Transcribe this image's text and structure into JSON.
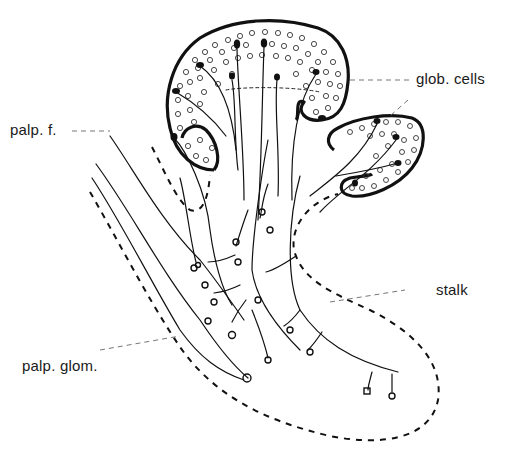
{
  "figure": {
    "labels": {
      "palp_f": "palp. f.",
      "glob_cells": "glob. cells",
      "stalk": "stalk",
      "palp_glom": "palp. glom."
    },
    "colors": {
      "ink": "#111111",
      "leader": "#777777",
      "background": "#ffffff"
    }
  }
}
